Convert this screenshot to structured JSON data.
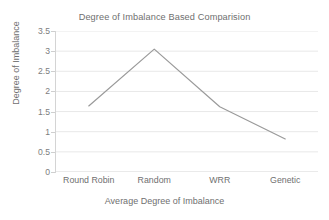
{
  "chart_data": {
    "type": "line",
    "title": "Degree of Imbalance Based Comparision",
    "xlabel": "Average Degree of Imbalance",
    "ylabel": "Degree of Imbalance",
    "categories": [
      "Round Robin",
      "Random",
      "WRR",
      "Genetic"
    ],
    "values": [
      1.64,
      3.05,
      1.62,
      0.82
    ],
    "series": [
      {
        "name": "Degree of Imbalance",
        "values": [
          1.64,
          3.05,
          1.62,
          0.82
        ]
      }
    ],
    "ylim": [
      0,
      3.5
    ],
    "ytick_labels": [
      "0",
      "0.5",
      "1",
      "1.5",
      "2",
      "2.5",
      "3",
      "3.5"
    ],
    "ytick_values": [
      0,
      0.5,
      1,
      1.5,
      2,
      2.5,
      3,
      3.5
    ],
    "grid": true,
    "grid_axis": "y",
    "legend": false,
    "legend_position": "none",
    "line_color": "#9a9a9a",
    "grid_color": "#e8e8e8",
    "axis_color": "#d4d4d4",
    "text_color": "#6f6f6f",
    "background_color": "#ffffff"
  }
}
